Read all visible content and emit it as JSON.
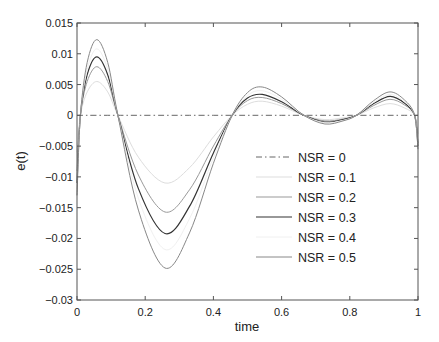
{
  "chart_data": {
    "type": "line",
    "title": "",
    "xlabel": "time",
    "ylabel": "e(t)",
    "xlim": [
      0,
      1
    ],
    "ylim": [
      -0.03,
      0.015
    ],
    "xticks": [
      0,
      0.2,
      0.4,
      0.6,
      0.8,
      1
    ],
    "xtick_labels": [
      "0",
      "0.2",
      "0.4",
      "0.6",
      "0.8",
      "1"
    ],
    "yticks": [
      0.015,
      0.01,
      0.005,
      0,
      -0.005,
      -0.01,
      -0.015,
      -0.02,
      -0.025,
      -0.03
    ],
    "ytick_labels": [
      "0.015",
      "0.01",
      "0.005",
      "0",
      "−0.005",
      "−0.01",
      "−0.015",
      "−0.02",
      "−0.025",
      "−0.03"
    ],
    "grid": false,
    "legend_position": "lower right (inside)",
    "x": [
      0,
      0.01,
      0.03,
      0.058,
      0.09,
      0.12,
      0.18,
      0.258,
      0.33,
      0.4,
      0.455,
      0.5,
      0.543,
      0.6,
      0.665,
      0.727,
      0.78,
      0.82,
      0.87,
      0.918,
      0.96,
      0.99,
      1.0
    ],
    "series": [
      {
        "name": "NSR = 0",
        "color": "#555555",
        "dash": "6,3,1.5,3",
        "width": 0.9,
        "values": [
          0,
          0,
          0,
          0,
          0,
          0,
          0,
          0,
          0,
          0,
          0,
          0,
          0,
          0,
          0,
          0,
          0,
          0,
          0,
          0,
          0,
          0,
          0
        ]
      },
      {
        "name": "NSR = 0.1",
        "color": "#dddddd",
        "dash": "",
        "width": 1.0,
        "values": [
          -0.006,
          0.0,
          0.0038,
          0.0055,
          0.0038,
          0.0,
          -0.0068,
          -0.011,
          -0.0085,
          -0.0035,
          0.0,
          0.0018,
          0.0023,
          0.0015,
          0.0,
          -0.0007,
          -0.0004,
          0.0,
          0.0012,
          0.0019,
          0.0012,
          0.0,
          -0.003
        ]
      },
      {
        "name": "NSR = 0.2",
        "color": "#999999",
        "dash": "",
        "width": 1.0,
        "values": [
          -0.009,
          0.0,
          0.0055,
          0.0079,
          0.0055,
          0.0,
          -0.0097,
          -0.0157,
          -0.0121,
          -0.005,
          0.0,
          0.0024,
          0.0029,
          0.0019,
          0.0,
          -0.0009,
          -0.0006,
          0.0,
          0.0016,
          0.0026,
          0.0017,
          0.0,
          -0.0045
        ]
      },
      {
        "name": "NSR = 0.3",
        "color": "#333333",
        "dash": "",
        "width": 1.2,
        "values": [
          -0.011,
          0.0,
          0.0066,
          0.0095,
          0.0066,
          0.0,
          -0.0119,
          -0.0192,
          -0.0148,
          -0.0061,
          0.0,
          0.0028,
          0.0034,
          0.0022,
          0.0,
          -0.0011,
          -0.0007,
          0.0,
          0.0019,
          0.0031,
          0.002,
          0.0,
          -0.005
        ]
      },
      {
        "name": "NSR = 0.4",
        "color": "#f0f0f0",
        "dash": "",
        "width": 1.0,
        "values": [
          -0.012,
          0.0,
          0.0075,
          0.0108,
          0.0075,
          0.0,
          -0.0135,
          -0.0218,
          -0.0168,
          -0.0069,
          0.0,
          0.0032,
          0.004,
          0.0026,
          0.0,
          -0.0012,
          -0.0008,
          0.0,
          0.0021,
          0.0034,
          0.0022,
          0.0,
          -0.0052
        ]
      },
      {
        "name": "NSR = 0.5",
        "color": "#888888",
        "dash": "",
        "width": 1.0,
        "values": [
          -0.013,
          0.0,
          0.0086,
          0.0123,
          0.0086,
          0.0,
          -0.0154,
          -0.0248,
          -0.0191,
          -0.0078,
          0.0,
          0.0037,
          0.0046,
          0.003,
          0.0,
          -0.0014,
          -0.0009,
          0.0,
          0.0024,
          0.0038,
          0.0025,
          0.0,
          -0.0055
        ]
      }
    ]
  }
}
